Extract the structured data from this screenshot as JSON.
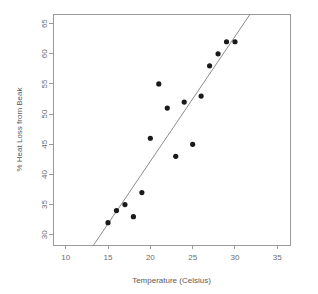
{
  "chart_data": {
    "type": "scatter",
    "title": "",
    "xlabel": "Temperature (Celsius)",
    "ylabel": "% Heat Loss from Beak",
    "xlim": [
      8.5,
      36.5
    ],
    "ylim": [
      28.3,
      66.6
    ],
    "xticks": [
      10,
      15,
      20,
      25,
      30,
      35
    ],
    "yticks": [
      30,
      35,
      40,
      45,
      50,
      55,
      60,
      65
    ],
    "xtick_labels": [
      "10",
      "15",
      "20",
      "25",
      "30",
      "35"
    ],
    "ytick_labels": [
      "30",
      "35",
      "40",
      "45",
      "50",
      "55",
      "60",
      "65"
    ],
    "grid": false,
    "legend": false,
    "legend_position": "none",
    "point_color": "#1a1a1a",
    "point_size": 2.6,
    "axis_color": "#9a9a9a",
    "label_color": "#6d6d6d",
    "x": [
      15,
      16,
      17,
      18,
      19,
      20,
      21,
      22,
      23,
      24,
      25,
      26,
      27,
      28,
      29,
      30
    ],
    "y": [
      32,
      34,
      35,
      33,
      37,
      46,
      55,
      51,
      43,
      52,
      45,
      53,
      58,
      60,
      62,
      62
    ],
    "points": [
      {
        "x": 15,
        "y": 32
      },
      {
        "x": 16,
        "y": 34
      },
      {
        "x": 17,
        "y": 35
      },
      {
        "x": 18,
        "y": 33
      },
      {
        "x": 19,
        "y": 37
      },
      {
        "x": 20,
        "y": 46
      },
      {
        "x": 21,
        "y": 55
      },
      {
        "x": 22,
        "y": 51
      },
      {
        "x": 23,
        "y": 43
      },
      {
        "x": 24,
        "y": 52
      },
      {
        "x": 25,
        "y": 45
      },
      {
        "x": 26,
        "y": 53
      },
      {
        "x": 27,
        "y": 58
      },
      {
        "x": 28,
        "y": 60
      },
      {
        "x": 29,
        "y": 62
      },
      {
        "x": 30,
        "y": 62
      }
    ],
    "series": [
      {
        "name": "observations",
        "type": "scatter",
        "values": [
          32,
          34,
          35,
          33,
          37,
          46,
          55,
          51,
          43,
          52,
          45,
          53,
          58,
          60,
          62,
          62
        ]
      },
      {
        "name": "fitted-line",
        "type": "line",
        "x_start": 13.3,
        "y_start": 28.3,
        "x_end": 31.8,
        "y_end": 66.6
      }
    ],
    "fit_line": {
      "x_start": 13.3,
      "y_start": 28.3,
      "x_end": 31.8,
      "y_end": 66.6,
      "color": "#8d8d8d"
    }
  }
}
